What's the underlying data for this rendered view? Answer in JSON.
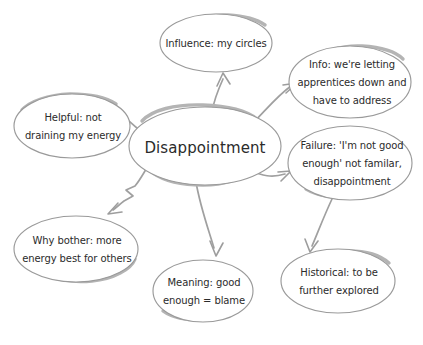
{
  "diagram": {
    "type": "mind-map",
    "title": "Disappointment",
    "style": "hand-drawn sketch, gray ellipses on white background",
    "colors": {
      "background": "#ffffff",
      "node_outline": "#9a9a9a",
      "node_shadow": "#b4b4b4",
      "connector": "#a0a0a0",
      "text": "#2b2b2b"
    },
    "central_node": {
      "id": "central",
      "label": "Disappointment",
      "lines": [
        "Disappointment"
      ],
      "cx": 205,
      "cy": 146,
      "rx": 76,
      "ry": 39
    },
    "nodes": [
      {
        "id": "influence",
        "label": "Influence: my circles",
        "lines": [
          "Influence: my circles"
        ],
        "cx": 216,
        "cy": 43,
        "rx": 56,
        "ry": 29
      },
      {
        "id": "info",
        "label": "Info: we're letting apprentices down and have to address",
        "lines": [
          "Info: we're letting",
          "apprentices down and",
          "have to address"
        ],
        "cx": 350,
        "cy": 82,
        "rx": 61,
        "ry": 36
      },
      {
        "id": "failure",
        "label": "Failure: 'I'm not good enough' not familar, disappointment",
        "lines": [
          "Failure: 'I'm not good",
          "enough' not familar,",
          "disappointment"
        ],
        "cx": 350,
        "cy": 163,
        "rx": 62,
        "ry": 37
      },
      {
        "id": "historical",
        "label": "Historical: to be further explored",
        "lines": [
          "Historical: to be",
          "further explored"
        ],
        "cx": 338,
        "cy": 281,
        "rx": 57,
        "ry": 32
      },
      {
        "id": "meaning",
        "label": "Meaning: good enough = blame",
        "lines": [
          "Meaning: good",
          "enough = blame"
        ],
        "cx": 203,
        "cy": 291,
        "rx": 50,
        "ry": 31
      },
      {
        "id": "why-bother",
        "label": "Why bother: more energy best for others",
        "lines": [
          "Why bother: more",
          "energy best for others"
        ],
        "cx": 76,
        "cy": 249,
        "rx": 62,
        "ry": 33
      },
      {
        "id": "helpful",
        "label": "Helpful: not draining my energy",
        "lines": [
          "Helpful: not",
          "draining my energy"
        ],
        "cx": 72,
        "cy": 126,
        "rx": 58,
        "ry": 32
      }
    ],
    "connections": [
      {
        "from": "central",
        "to": "influence",
        "direction": "up"
      },
      {
        "from": "central",
        "to": "info",
        "direction": "up-right"
      },
      {
        "from": "central",
        "to": "failure",
        "direction": "right"
      },
      {
        "from": "failure",
        "to": "historical",
        "direction": "down"
      },
      {
        "from": "central",
        "to": "meaning",
        "direction": "down"
      },
      {
        "from": "central",
        "to": "why-bother",
        "direction": "down-left"
      },
      {
        "from": "central",
        "to": "helpful",
        "direction": "left"
      }
    ]
  }
}
